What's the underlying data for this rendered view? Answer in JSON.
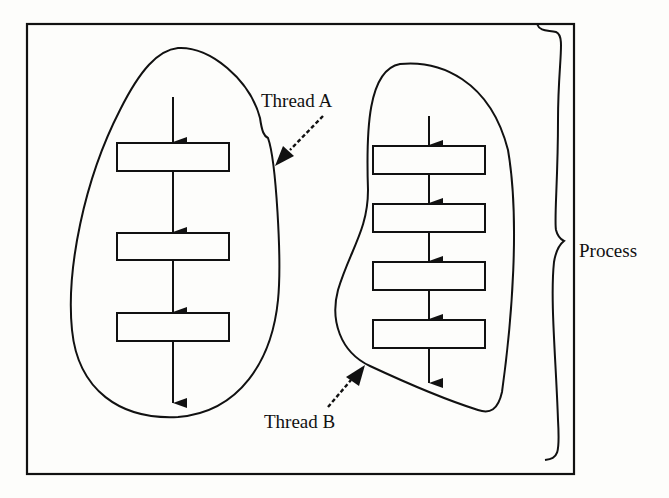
{
  "diagram": {
    "type": "process-threads",
    "labels": {
      "thread_a": "Thread A",
      "thread_b": "Thread B",
      "process": "Process"
    },
    "threads": [
      {
        "name": "Thread A",
        "steps": 3
      },
      {
        "name": "Thread B",
        "steps": 4
      }
    ],
    "colors": {
      "ink": "#111111",
      "background": "#fdfdfb"
    }
  }
}
